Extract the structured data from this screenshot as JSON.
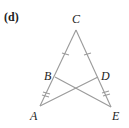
{
  "figure": {
    "label": "(d)",
    "line_color": "#9a9a9a",
    "points": {
      "A": {
        "label": "A",
        "x": 40,
        "y": 106
      },
      "B": {
        "label": "B",
        "x": 55,
        "y": 77
      },
      "C": {
        "label": "C",
        "x": 76,
        "y": 30
      },
      "D": {
        "label": "D",
        "x": 98,
        "y": 77
      },
      "E": {
        "label": "E",
        "x": 111,
        "y": 107
      }
    },
    "segments": [
      "CA",
      "CE",
      "AD",
      "BE"
    ],
    "tick_marks": [
      {
        "segment": "CB",
        "count": 1
      },
      {
        "segment": "CD",
        "count": 1
      },
      {
        "segment": "BA",
        "count": 2
      },
      {
        "segment": "DE",
        "count": 2
      }
    ]
  }
}
